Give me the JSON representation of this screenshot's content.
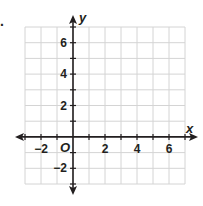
{
  "figure_marker": ".",
  "chart_data": {
    "type": "line",
    "title": "",
    "xlabel": "x",
    "ylabel": "y",
    "origin_label": "O",
    "xlim": [
      -3,
      7
    ],
    "ylim": [
      -3,
      7
    ],
    "grid": true,
    "grid_step": 1,
    "x_tick_labels": [
      {
        "value": -2,
        "label": "−2"
      },
      {
        "value": 2,
        "label": "2"
      },
      {
        "value": 4,
        "label": "4"
      },
      {
        "value": 6,
        "label": "6"
      }
    ],
    "y_tick_labels": [
      {
        "value": 6,
        "label": "6"
      },
      {
        "value": 4,
        "label": "4"
      },
      {
        "value": 2,
        "label": "2"
      },
      {
        "value": -2,
        "label": "−2"
      }
    ],
    "series": [],
    "colors": {
      "grid": "#d4d4d4",
      "axis": "#231f20",
      "text": "#231f20"
    }
  }
}
